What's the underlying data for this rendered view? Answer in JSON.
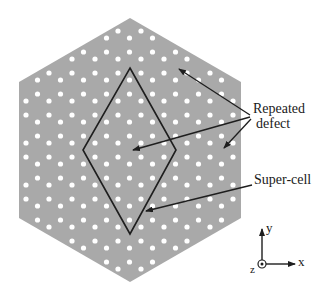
{
  "figure": {
    "background_color": "#ffffff",
    "crystal_fill": "#a9a9a9",
    "hole_color": "#ffffff",
    "line_color": "#1e1e1e",
    "hexagon": [
      [
        130,
        18
      ],
      [
        241,
        82
      ],
      [
        241,
        218
      ],
      [
        130,
        282
      ],
      [
        19,
        218
      ],
      [
        19,
        82
      ]
    ],
    "supercell": [
      [
        130,
        68
      ],
      [
        176,
        150
      ],
      [
        130,
        234
      ],
      [
        83,
        150
      ]
    ],
    "defects": [
      [
        177,
        67
      ],
      [
        130,
        150
      ],
      [
        222,
        150
      ]
    ]
  },
  "labels": {
    "repeated_defect_line1": "Repeated",
    "repeated_defect_line2": "defect",
    "super_cell": "Super-cell"
  },
  "axes": {
    "x_label": "x",
    "y_label": "y",
    "z_label": "z"
  }
}
